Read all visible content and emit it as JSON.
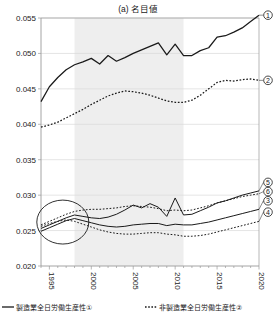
{
  "chart_data": {
    "type": "line",
    "title": "(a) 名目値",
    "xlabel": "",
    "ylabel": "",
    "xlim": [
      1994,
      2020
    ],
    "ylim": [
      0.02,
      0.055
    ],
    "yticks": [
      "0.020",
      "0.025",
      "0.030",
      "0.035",
      "0.040",
      "0.045",
      "0.050",
      "0.055"
    ],
    "ytick_values": [
      0.02,
      0.025,
      0.03,
      0.035,
      0.04,
      0.045,
      0.05,
      0.055
    ],
    "xticks": [
      "1995",
      "2000",
      "2005",
      "2010",
      "2015",
      "2020"
    ],
    "xtick_values": [
      1995,
      2000,
      2005,
      2010,
      2015,
      2020
    ],
    "grid": true,
    "legend_position": "bottom",
    "x": [
      1994,
      1995,
      1996,
      1997,
      1998,
      1999,
      2000,
      2001,
      2002,
      2003,
      2004,
      2005,
      2006,
      2007,
      2008,
      2009,
      2010,
      2011,
      2012,
      2013,
      2014,
      2015,
      2016,
      2017,
      2018,
      2019,
      2020
    ],
    "shaded_region": {
      "x_start": 1998,
      "x_end": 2011,
      "color": "#eeeeee",
      "label": ""
    },
    "annotation_ellipse": {
      "cx": 1996.6,
      "cy": 0.0262,
      "rx_years": 3.1,
      "ry_value": 0.0031,
      "label": ""
    },
    "series": [
      {
        "name": "製造業全日労働生産性",
        "marker": "①",
        "style": "solid",
        "color": "#1a1a1a",
        "values": [
          0.0432,
          0.0453,
          0.0466,
          0.0477,
          0.0484,
          0.0488,
          0.0493,
          0.0485,
          0.0497,
          0.0489,
          0.0494,
          0.05,
          0.0505,
          0.051,
          0.0515,
          0.0498,
          0.0513,
          0.0497,
          0.0497,
          0.0504,
          0.0508,
          0.0523,
          0.0525,
          0.053,
          0.0536,
          0.0545,
          0.0554
        ]
      },
      {
        "name": "非製造業全日労働生産性",
        "marker": "②",
        "style": "dotted",
        "color": "#1a1a1a",
        "values": [
          0.0396,
          0.0399,
          0.0403,
          0.0409,
          0.0415,
          0.0421,
          0.0428,
          0.0434,
          0.044,
          0.0444,
          0.0447,
          0.0446,
          0.0444,
          0.0441,
          0.0437,
          0.0433,
          0.0431,
          0.0431,
          0.0434,
          0.0441,
          0.045,
          0.0459,
          0.0462,
          0.0461,
          0.0463,
          0.0464,
          0.0462
        ]
      },
      {
        "name": "製造業系列③",
        "marker": "③",
        "style": "solid",
        "color": "#1a1a1a",
        "values": [
          0.0249,
          0.0254,
          0.0259,
          0.0264,
          0.0267,
          0.0264,
          0.0261,
          0.0258,
          0.0256,
          0.0255,
          0.0256,
          0.0258,
          0.0259,
          0.026,
          0.026,
          0.0257,
          0.0259,
          0.0258,
          0.0258,
          0.026,
          0.0262,
          0.0265,
          0.0268,
          0.0271,
          0.0274,
          0.0277,
          0.028
        ]
      },
      {
        "name": "非製造業系列④",
        "marker": "④",
        "style": "dotted",
        "color": "#1a1a1a",
        "values": [
          0.0256,
          0.026,
          0.0263,
          0.0265,
          0.0263,
          0.0259,
          0.0255,
          0.0251,
          0.0248,
          0.0246,
          0.0245,
          0.0245,
          0.0246,
          0.0247,
          0.0247,
          0.0245,
          0.0244,
          0.0242,
          0.0242,
          0.0243,
          0.0245,
          0.0248,
          0.0251,
          0.0254,
          0.0257,
          0.026,
          0.0263
        ]
      },
      {
        "name": "製造業系列⑤",
        "marker": "⑤",
        "style": "solid",
        "color": "#1a1a1a",
        "values": [
          0.0253,
          0.0258,
          0.0263,
          0.0268,
          0.0272,
          0.027,
          0.0268,
          0.0267,
          0.0269,
          0.0273,
          0.0279,
          0.0286,
          0.0282,
          0.0288,
          0.0283,
          0.027,
          0.0296,
          0.0272,
          0.0273,
          0.0278,
          0.0283,
          0.0289,
          0.0292,
          0.0296,
          0.03,
          0.0303,
          0.0306
        ]
      },
      {
        "name": "非製造業系列⑥",
        "marker": "⑥",
        "style": "dotted",
        "color": "#1a1a1a",
        "values": [
          0.0258,
          0.0263,
          0.0268,
          0.0273,
          0.0277,
          0.0279,
          0.028,
          0.028,
          0.0281,
          0.0282,
          0.0284,
          0.0285,
          0.0284,
          0.0283,
          0.0281,
          0.0278,
          0.0279,
          0.0278,
          0.0279,
          0.0282,
          0.0285,
          0.0289,
          0.0292,
          0.0295,
          0.0298,
          0.03,
          0.0302
        ]
      }
    ]
  },
  "legend": {
    "items": [
      {
        "label": "製造業全日労働生産性①",
        "style": "solid"
      },
      {
        "label": "非製造業全日労働生産性②",
        "style": "dotted"
      }
    ]
  },
  "markers": {
    "m1": "①",
    "m2": "②",
    "m3": "③",
    "m4": "④",
    "m5": "⑤",
    "m6": "⑥"
  },
  "colors": {
    "line": "#1a1a1a",
    "grid": "#d8d8d8",
    "axis": "#9a9a9a",
    "shade": "#eeeeee",
    "text": "#1a1a1a"
  }
}
